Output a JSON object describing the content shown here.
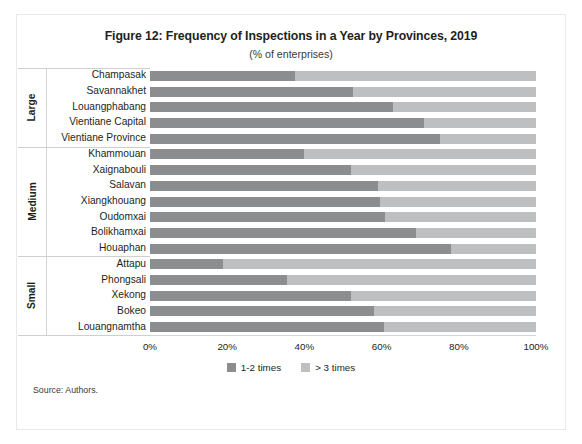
{
  "figure": {
    "title": "Figure 12: Frequency of Inspections in a Year by Provinces, 2019",
    "subtitle": "(% of enterprises)",
    "source": "Source: Authors."
  },
  "legend": {
    "items": [
      {
        "label": "1-2 times",
        "color": "#8b8d8f"
      },
      {
        "label": "> 3 times",
        "color": "#bdbfc1"
      }
    ]
  },
  "groups": [
    {
      "label": "Large",
      "count": 5
    },
    {
      "label": "Medium",
      "count": 7
    },
    {
      "label": "Small",
      "count": 5
    }
  ],
  "xaxis": {
    "ticks": [
      "0%",
      "20%",
      "40%",
      "60%",
      "80%",
      "100%"
    ],
    "min": 0,
    "max": 100
  },
  "chart_data": {
    "type": "bar",
    "orientation": "horizontal",
    "stacked": true,
    "stacked_total": 100,
    "title": "Figure 12: Frequency of Inspections in a Year by Provinces, 2019",
    "subtitle": "(% of enterprises)",
    "xlabel": "",
    "ylabel": "",
    "xlim": [
      0,
      100
    ],
    "xticks": [
      0,
      20,
      40,
      60,
      80,
      100
    ],
    "xtick_labels": [
      "0%",
      "20%",
      "40%",
      "60%",
      "80%",
      "100%"
    ],
    "grid": false,
    "legend_position": "bottom",
    "categories": [
      "Champasak",
      "Savannakhet",
      "Louangphabang",
      "Vientiane Capital",
      "Vientiane Province",
      "Khammouan",
      "Xaignabouli",
      "Salavan",
      "Xiangkhouang",
      "Oudomxai",
      "Bolikhamxai",
      "Houaphan",
      "Attapu",
      "Phongsali",
      "Xekong",
      "Bokeo",
      "Louangnamtha"
    ],
    "category_groups": [
      "Large",
      "Large",
      "Large",
      "Large",
      "Large",
      "Medium",
      "Medium",
      "Medium",
      "Medium",
      "Medium",
      "Medium",
      "Medium",
      "Small",
      "Small",
      "Small",
      "Small",
      "Small"
    ],
    "series": [
      {
        "name": "1-2 times",
        "color": "#8b8d8f",
        "values": [
          37.5,
          52.5,
          63.0,
          71.0,
          75.0,
          40.0,
          52.0,
          59.0,
          59.5,
          61.0,
          69.0,
          78.0,
          19.0,
          35.5,
          52.0,
          58.0,
          60.5
        ]
      },
      {
        "name": "> 3 times",
        "color": "#bdbfc1",
        "values": [
          62.5,
          47.5,
          37.0,
          29.0,
          25.0,
          60.0,
          48.0,
          41.0,
          40.5,
          39.0,
          31.0,
          22.0,
          81.0,
          64.5,
          48.0,
          42.0,
          39.5
        ]
      }
    ]
  }
}
